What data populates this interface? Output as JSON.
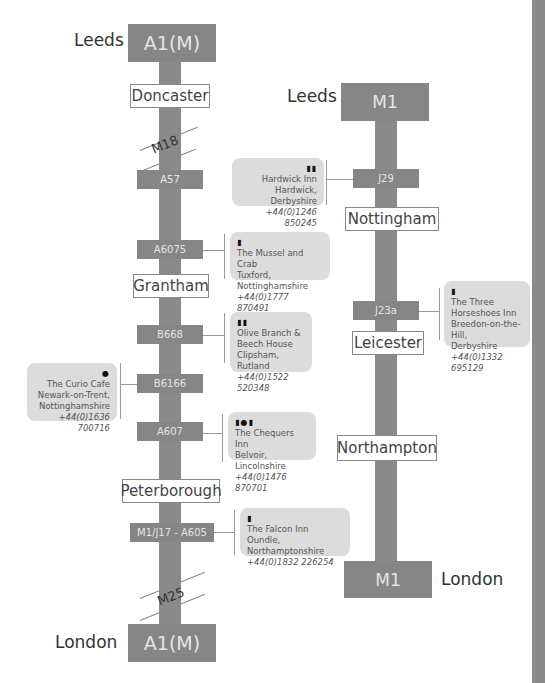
{
  "a1m": {
    "top_dest": "Leeds",
    "top_road": "A1(M)",
    "bottom_dest": "London",
    "bottom_road": "A1(M)",
    "towns": [
      "Doncaster",
      "Grantham",
      "Peterborough"
    ],
    "crossings": [
      "M18",
      "M25"
    ],
    "junctions": [
      "A57",
      "A6075",
      "B668",
      "B6166",
      "A607",
      "M1/J17 - A605"
    ]
  },
  "m1": {
    "top_dest": "Leeds",
    "top_road": "M1",
    "bottom_dest": "London",
    "bottom_road": "M1",
    "towns": [
      "Nottingham",
      "Leicester",
      "Northampton"
    ],
    "junctions": [
      "J29",
      "J23a"
    ]
  },
  "venues": [
    {
      "icons": "pub-icon restaurant-icon",
      "glyph": "▮▮",
      "name": "Hardwick Inn",
      "place": "Hardwick, Derbyshire",
      "phone": "+44(0)1246 850245"
    },
    {
      "icons": "pub-icon",
      "glyph": "▮",
      "name": "The Mussel and Crab",
      "place": "Tuxford, Nottinghamshire",
      "phone": "+44(0)1777 870491"
    },
    {
      "icons": "restaurant-icon pub-icon",
      "glyph": "▮▮",
      "name": "Olive Branch &",
      "name2": "Beech House",
      "place": "Clipsham, Rutland",
      "phone": "+44(0)1522 520348"
    },
    {
      "icons": "cafe-icon",
      "glyph": "●",
      "name": "The Curio Cafe",
      "place": "Newark-on-Trent,",
      "place2": "Nottinghamshire",
      "phone": "+44(0)1636 700716"
    },
    {
      "icons": "restaurant-icon cafe-icon pub-icon",
      "glyph": "▮●▮",
      "name": "The Chequers Inn",
      "place": "Belvoir, Lincolnshire",
      "phone": "+44(0)1476 870701"
    },
    {
      "icons": "pub-icon",
      "glyph": "▮",
      "name": "The Falcon Inn",
      "place": "Oundle, Northamptonshire",
      "phone": "+44(0)1832 226254"
    },
    {
      "icons": "pub-icon",
      "glyph": "▮",
      "name": "The Three",
      "name2": "Horseshoes Inn",
      "place": "Breedon-on-the-Hill,",
      "place2": "Derbyshire",
      "phone": "+44(0)1332 695129"
    }
  ]
}
